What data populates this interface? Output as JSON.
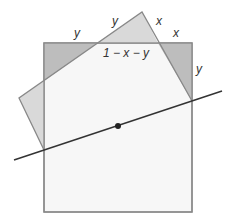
{
  "diagram": {
    "labels": {
      "top_left_y": "y",
      "upper_y": "y",
      "upper_x": "x",
      "right_x": "x",
      "middle": "1 − x − y",
      "right_y": "y"
    },
    "colors": {
      "square_fill": "#f7f7f7",
      "square_stroke": "#888888",
      "light_triangle": "#d9d9d9",
      "dark_triangle": "#bdbdbd",
      "line": "#333333",
      "dot": "#222222"
    }
  }
}
